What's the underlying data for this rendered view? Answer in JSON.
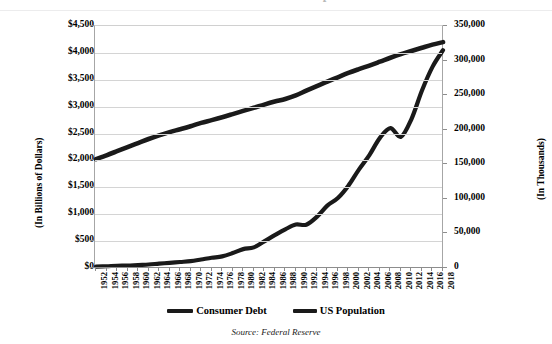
{
  "chart_data": {
    "type": "line",
    "title": "Consumer Debt vs US Population",
    "subtitle": "",
    "xlabel": "",
    "ylabel": "(In Billions of Dollars)",
    "y2label": "(In Thousands)",
    "source_note": "Source: Federal Reserve",
    "grid": true,
    "legend_position": "bottom",
    "ylim": [
      0,
      4500
    ],
    "y2lim": [
      0,
      350000
    ],
    "ytick_labels": [
      "$0",
      "$500",
      "$1,000",
      "$1,500",
      "$2,000",
      "$2,500",
      "$3,000",
      "$3,500",
      "$4,000",
      "$4,500"
    ],
    "ytick_values": [
      0,
      500,
      1000,
      1500,
      2000,
      2500,
      3000,
      3500,
      4000,
      4500
    ],
    "y2tick_labels": [
      "0",
      "50,000",
      "100,000",
      "150,000",
      "200,000",
      "250,000",
      "300,000",
      "350,000"
    ],
    "y2tick_values": [
      0,
      50000,
      100000,
      150000,
      200000,
      250000,
      300000,
      350000
    ],
    "categories": [
      "1952",
      "1954",
      "1956",
      "1958",
      "1960",
      "1962",
      "1964",
      "1966",
      "1968",
      "1970",
      "1972",
      "1974",
      "1976",
      "1978",
      "1980",
      "1982",
      "1984",
      "1986",
      "1988",
      "1990",
      "1992",
      "1994",
      "1996",
      "1998",
      "2000",
      "2002",
      "2004",
      "2006",
      "2008",
      "2010",
      "2012",
      "2014",
      "2016",
      "2018"
    ],
    "x": [
      1952,
      1954,
      1956,
      1958,
      1960,
      1962,
      1964,
      1966,
      1968,
      1970,
      1972,
      1974,
      1976,
      1978,
      1980,
      1982,
      1984,
      1986,
      1988,
      1990,
      1992,
      1994,
      1996,
      1998,
      2000,
      2002,
      2004,
      2006,
      2008,
      2010,
      2012,
      2014,
      2016,
      2018
    ],
    "series": [
      {
        "name": "Consumer Debt",
        "axis": "left",
        "units": "Billions of Dollars",
        "color": "#1a1a1a",
        "values": [
          27,
          33,
          42,
          45,
          56,
          65,
          81,
          95,
          111,
          127,
          158,
          190,
          216,
          277,
          351,
          384,
          496,
          610,
          719,
          808,
          806,
          951,
          1160,
          1300,
          1530,
          1830,
          2100,
          2420,
          2600,
          2440,
          2770,
          3300,
          3740,
          4050
        ]
      },
      {
        "name": "US Population",
        "axis": "right",
        "units": "Thousands",
        "color": "#1a1a1a",
        "values": [
          157553,
          163026,
          168903,
          174882,
          180671,
          186538,
          191889,
          196560,
          200706,
          205052,
          209896,
          213854,
          218035,
          222585,
          227225,
          231664,
          236348,
          240683,
          244499,
          249623,
          256514,
          263126,
          269394,
          275854,
          282162,
          287625,
          292805,
          298380,
          304094,
          309327,
          313914,
          318563,
          323072,
          326688
        ]
      }
    ],
    "legend": [
      "Consumer Debt",
      "US Population"
    ]
  },
  "axes": {
    "left_title": "(In Billions of Dollars)",
    "right_title": "(In Thousands)"
  },
  "footer": {
    "source": "Source: Federal Reserve"
  },
  "colors": {
    "line": "#1a1a1a",
    "grid": "#d4d4d4",
    "axis": "#8d8d8d",
    "background": "#ffffff"
  }
}
